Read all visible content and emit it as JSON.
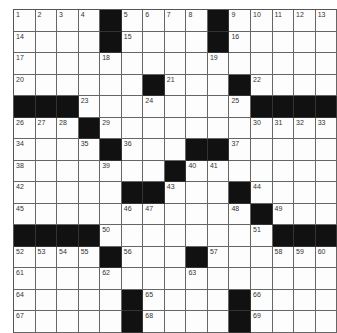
{
  "puzzle": {
    "rows": 15,
    "cols": 15,
    "colors": {
      "black": "#111111",
      "white": "#fdfdfd",
      "line": "#666666"
    },
    "grid": [
      [
        "1",
        "2",
        "3",
        "4",
        "#",
        "5",
        "6",
        "7",
        "8",
        "#",
        "9",
        "10",
        "11",
        "12",
        "13"
      ],
      [
        "14",
        "",
        "",
        "",
        "#",
        "15",
        "",
        "",
        "",
        "#",
        "16",
        "",
        "",
        "",
        ""
      ],
      [
        "17",
        "",
        "",
        "",
        "18",
        "",
        "",
        "",
        "",
        "19",
        "",
        "",
        "",
        "",
        ""
      ],
      [
        "20",
        "",
        "",
        "",
        "",
        "",
        "#",
        "21",
        "",
        "",
        "#",
        "22",
        "",
        "",
        ""
      ],
      [
        "#",
        "#",
        "#",
        "23",
        "",
        "",
        "24",
        "",
        "",
        "",
        "25",
        "#",
        "#",
        "#",
        "#"
      ],
      [
        "26",
        "27",
        "28",
        "#",
        "29",
        "",
        "",
        "",
        "",
        "",
        "",
        "30",
        "31",
        "32",
        "33"
      ],
      [
        "34",
        "",
        "",
        "35",
        "#",
        "36",
        "",
        "",
        "#",
        "#",
        "37",
        "",
        "",
        "",
        ""
      ],
      [
        "38",
        "",
        "",
        "",
        "39",
        "",
        "",
        "#",
        "40",
        "41",
        "",
        "",
        "",
        "",
        ""
      ],
      [
        "42",
        "",
        "",
        "",
        "",
        "#",
        "#",
        "43",
        "",
        "",
        "#",
        "44",
        "",
        "",
        ""
      ],
      [
        "45",
        "",
        "",
        "",
        "",
        "46",
        "47",
        "",
        "",
        "",
        "48",
        "#",
        "49",
        "",
        ""
      ],
      [
        "#",
        "#",
        "#",
        "#",
        "50",
        "",
        "",
        "",
        "",
        "",
        "",
        "51",
        "#",
        "#",
        "#"
      ],
      [
        "52",
        "53",
        "54",
        "55",
        "#",
        "56",
        "",
        "",
        "#",
        "57",
        "",
        "",
        "58",
        "59",
        "60"
      ],
      [
        "61",
        "",
        "",
        "",
        "62",
        "",
        "",
        "",
        "63",
        "",
        "",
        "",
        "",
        "",
        ""
      ],
      [
        "64",
        "",
        "",
        "",
        "",
        "#",
        "65",
        "",
        "",
        "",
        "#",
        "66",
        "",
        "",
        ""
      ],
      [
        "67",
        "",
        "",
        "",
        "",
        "#",
        "68",
        "",
        "",
        "",
        "#",
        "69",
        "",
        "",
        ""
      ]
    ]
  }
}
